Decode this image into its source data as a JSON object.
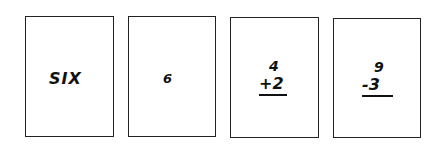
{
  "cards": [
    {
      "label": "SIX"
    },
    {
      "label": "6"
    },
    {
      "top": "4",
      "bottom": "+2"
    },
    {
      "top": "9",
      "bottom": "-3"
    }
  ]
}
